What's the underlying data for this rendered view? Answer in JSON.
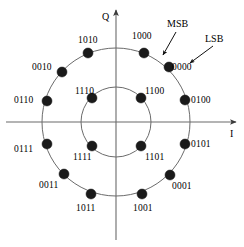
{
  "figure": {
    "type": "constellation-diagram",
    "title": "",
    "axes": {
      "x_label": "I",
      "y_label": "Q",
      "origin": [
        116,
        122
      ],
      "x_axis_from": [
        6,
        122
      ],
      "x_axis_to": [
        236,
        122
      ],
      "y_axis_from": [
        116,
        240
      ],
      "y_axis_to": [
        116,
        10
      ]
    },
    "rings": [
      {
        "name": "outer-ring",
        "radius": 74,
        "point_count": 12
      },
      {
        "name": "inner-ring",
        "radius": 35,
        "point_count": 4
      }
    ],
    "annotations": [
      {
        "name": "msb-annotation",
        "text": "MSB",
        "text_x": 167,
        "text_y": 18,
        "arrow_from": [
          176,
          32
        ],
        "arrow_to": [
          163,
          55
        ]
      },
      {
        "name": "lsb-annotation",
        "text": "LSB",
        "text_x": 205,
        "text_y": 33,
        "arrow_from": [
          213,
          46
        ],
        "arrow_to": [
          190,
          63
        ]
      }
    ],
    "points": [
      {
        "label": "1000",
        "ring": "outer",
        "angle_deg": 67.5,
        "dot_x": 144,
        "dot_y": 53,
        "lbl_x": 132,
        "lbl_y": 31
      },
      {
        "label": "1010",
        "ring": "outer",
        "angle_deg": 112.5,
        "dot_x": 88,
        "dot_y": 53,
        "lbl_x": 78,
        "lbl_y": 35
      },
      {
        "label": "0010",
        "ring": "outer",
        "angle_deg": 142.5,
        "dot_x": 62,
        "dot_y": 72,
        "lbl_x": 32,
        "lbl_y": 62
      },
      {
        "label": "0110",
        "ring": "outer",
        "angle_deg": 172.5,
        "dot_x": 47,
        "dot_y": 101,
        "lbl_x": 14,
        "lbl_y": 95
      },
      {
        "label": "0111",
        "ring": "outer",
        "angle_deg": 187.5,
        "dot_x": 47,
        "dot_y": 144,
        "lbl_x": 14,
        "lbl_y": 144
      },
      {
        "label": "0011",
        "ring": "outer",
        "angle_deg": 217.5,
        "dot_x": 64,
        "dot_y": 174,
        "lbl_x": 39,
        "lbl_y": 180
      },
      {
        "label": "1011",
        "ring": "outer",
        "angle_deg": 247.5,
        "dot_x": 91,
        "dot_y": 194,
        "lbl_x": 76,
        "lbl_y": 203
      },
      {
        "label": "1001",
        "ring": "outer",
        "angle_deg": 292.5,
        "dot_x": 142,
        "dot_y": 194,
        "lbl_x": 133,
        "lbl_y": 203
      },
      {
        "label": "0001",
        "ring": "outer",
        "angle_deg": 322.5,
        "dot_x": 170,
        "dot_y": 175,
        "lbl_x": 172,
        "lbl_y": 181
      },
      {
        "label": "0101",
        "ring": "outer",
        "angle_deg": 352.5,
        "dot_x": 185,
        "dot_y": 144,
        "lbl_x": 191,
        "lbl_y": 139
      },
      {
        "label": "0100",
        "ring": "outer",
        "angle_deg": 7.5,
        "dot_x": 185,
        "dot_y": 100,
        "lbl_x": 191,
        "lbl_y": 95
      },
      {
        "label": "0000",
        "ring": "outer",
        "angle_deg": 37.5,
        "dot_x": 169,
        "dot_y": 67,
        "lbl_x": 172,
        "lbl_y": 62
      },
      {
        "label": "1100",
        "ring": "inner",
        "angle_deg": 45,
        "dot_x": 141,
        "dot_y": 98,
        "lbl_x": 145,
        "lbl_y": 86
      },
      {
        "label": "1110",
        "ring": "inner",
        "angle_deg": 135,
        "dot_x": 92,
        "dot_y": 98,
        "lbl_x": 75,
        "lbl_y": 86
      },
      {
        "label": "1111",
        "ring": "inner",
        "angle_deg": 225,
        "dot_x": 92,
        "dot_y": 146,
        "lbl_x": 73,
        "lbl_y": 152
      },
      {
        "label": "1101",
        "ring": "inner",
        "angle_deg": 315,
        "dot_x": 141,
        "dot_y": 146,
        "lbl_x": 145,
        "lbl_y": 152
      }
    ],
    "style": {
      "dot_color": "#1a1a1a",
      "dot_radius": 5,
      "line_color": "#6b6b6b",
      "axis_color": "#6b6b6b",
      "text_color": "#000000"
    }
  }
}
